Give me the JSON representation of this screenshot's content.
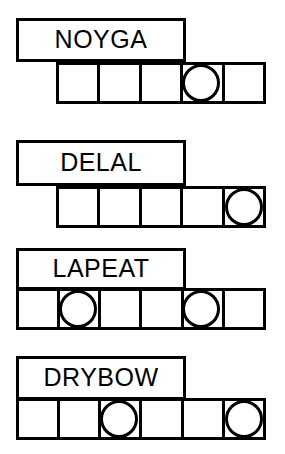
{
  "sheet": {
    "title": "Word Puzzle Worksheet",
    "background_color": "#ffffff",
    "ink_color": "#000000",
    "width": 285,
    "height": 454
  },
  "puzzles": [
    {
      "id": "puzzle-1",
      "word": "NOYGA",
      "word_box": {
        "x": 16,
        "y": 18,
        "width": 170,
        "height": 44
      },
      "grid": {
        "x": 56,
        "y": 62,
        "width": 210,
        "height": 42,
        "cell_count": 5,
        "circled_cells": [
          4
        ]
      }
    },
    {
      "id": "puzzle-2",
      "word": "DELAL",
      "word_box": {
        "x": 16,
        "y": 140,
        "width": 170,
        "height": 46
      },
      "grid": {
        "x": 56,
        "y": 186,
        "width": 210,
        "height": 42,
        "cell_count": 5,
        "circled_cells": [
          5
        ]
      }
    },
    {
      "id": "puzzle-3",
      "word": "LAPEAT",
      "word_box": {
        "x": 16,
        "y": 248,
        "width": 170,
        "height": 42
      },
      "grid": {
        "x": 16,
        "y": 288,
        "width": 250,
        "height": 42,
        "cell_count": 6,
        "circled_cells": [
          2,
          5
        ]
      }
    },
    {
      "id": "puzzle-4",
      "word": "DRYBOW",
      "word_box": {
        "x": 16,
        "y": 356,
        "width": 170,
        "height": 44
      },
      "grid": {
        "x": 16,
        "y": 398,
        "width": 250,
        "height": 42,
        "cell_count": 6,
        "circled_cells": [
          3,
          6
        ]
      }
    }
  ]
}
